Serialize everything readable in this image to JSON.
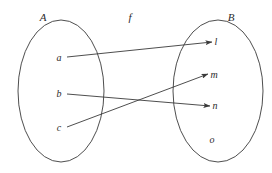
{
  "figure": {
    "type": "set-mapping-diagram",
    "background_color": "#ffffff",
    "stroke_color": "#3a3a3a",
    "text_color": "#2b2b2b",
    "mapping_label": "f",
    "domain": {
      "label": "A",
      "label_x": 43,
      "label_y": 21,
      "ellipse": {
        "cx": 61,
        "cy": 91,
        "rx": 43,
        "ry": 71
      },
      "elements": [
        {
          "name": "a",
          "x": 59,
          "y": 61,
          "anchor_x": 67,
          "anchor_y": 57
        },
        {
          "name": "b",
          "x": 59,
          "y": 97,
          "anchor_x": 67,
          "anchor_y": 94
        },
        {
          "name": "c",
          "x": 59,
          "y": 131,
          "anchor_x": 67,
          "anchor_y": 127
        }
      ]
    },
    "codomain": {
      "label": "B",
      "label_x": 231,
      "label_y": 21,
      "ellipse": {
        "cx": 218,
        "cy": 91,
        "rx": 45,
        "ry": 71
      },
      "elements": [
        {
          "name": "l",
          "x": 216,
          "y": 45,
          "target_x": 212,
          "target_y": 42
        },
        {
          "name": "m",
          "x": 213,
          "y": 78,
          "target_x": 208,
          "target_y": 74
        },
        {
          "name": "n",
          "x": 215,
          "y": 109,
          "target_x": 210,
          "target_y": 106
        },
        {
          "name": "o",
          "x": 212,
          "y": 143,
          "target_x": null,
          "target_y": null
        }
      ]
    },
    "mapping_label_x": 130,
    "mapping_label_y": 21,
    "arrows": [
      {
        "from": "a",
        "to": "l",
        "x1": 67,
        "y1": 57,
        "x2": 212,
        "y2": 42
      },
      {
        "from": "b",
        "to": "n",
        "x1": 67,
        "y1": 94,
        "x2": 210,
        "y2": 106
      },
      {
        "from": "c",
        "to": "m",
        "x1": 67,
        "y1": 127,
        "x2": 208,
        "y2": 74
      }
    ]
  }
}
